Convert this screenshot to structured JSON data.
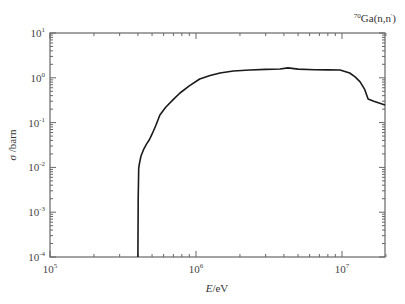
{
  "chart_data": {
    "type": "line",
    "title": "70Ga(n,n')",
    "title_parts": {
      "mass": "70",
      "text": "Ga(n,n",
      "prime": "'",
      "close": ")"
    },
    "xlabel": "E/eV",
    "xlabel_parts": {
      "var": "E",
      "unit": "/eV"
    },
    "ylabel": "σ /barn",
    "ylabel_parts": {
      "var": "σ",
      "unit": " /barn"
    },
    "xscale": "log",
    "yscale": "log",
    "xlim": [
      100000,
      20000000
    ],
    "ylim": [
      0.0001,
      10
    ],
    "grid": false,
    "legend": null,
    "x_ticks": [
      {
        "value": 100000,
        "base": "10",
        "exp": "5"
      },
      {
        "value": 1000000,
        "base": "10",
        "exp": "6"
      },
      {
        "value": 10000000,
        "base": "10",
        "exp": "7"
      }
    ],
    "y_ticks": [
      {
        "value": 10,
        "base": "10",
        "exp": "1"
      },
      {
        "value": 1,
        "base": "10",
        "exp": "0"
      },
      {
        "value": 0.1,
        "base": "10",
        "exp": "-1"
      },
      {
        "value": 0.01,
        "base": "10",
        "exp": "-2"
      },
      {
        "value": 0.001,
        "base": "10",
        "exp": "-3"
      },
      {
        "value": 0.0001,
        "base": "10",
        "exp": "-4"
      }
    ],
    "series": [
      {
        "name": "70Ga(n,n') cross section",
        "color": "#1a1a1a",
        "x": [
          400000,
          402000,
          405000,
          410000,
          420000,
          440000,
          460000,
          480000,
          500000,
          530000,
          566000,
          620000,
          700000,
          777000,
          900000,
          1060000,
          1250000,
          1460000,
          1800000,
          2340000,
          3000000,
          3760000,
          4270000,
          5000000,
          6500000,
          8000000,
          9700000,
          11300000,
          12300000,
          13300000,
          14300000,
          15100000,
          16500000,
          19700000
        ],
        "y": [
          0.0001,
          0.002,
          0.0095,
          0.0125,
          0.018,
          0.026,
          0.034,
          0.042,
          0.055,
          0.085,
          0.148,
          0.22,
          0.33,
          0.457,
          0.66,
          0.94,
          1.12,
          1.28,
          1.42,
          1.49,
          1.54,
          1.57,
          1.66,
          1.56,
          1.52,
          1.5,
          1.49,
          1.28,
          1.05,
          0.81,
          0.55,
          0.336,
          0.3,
          0.247
        ]
      }
    ]
  }
}
